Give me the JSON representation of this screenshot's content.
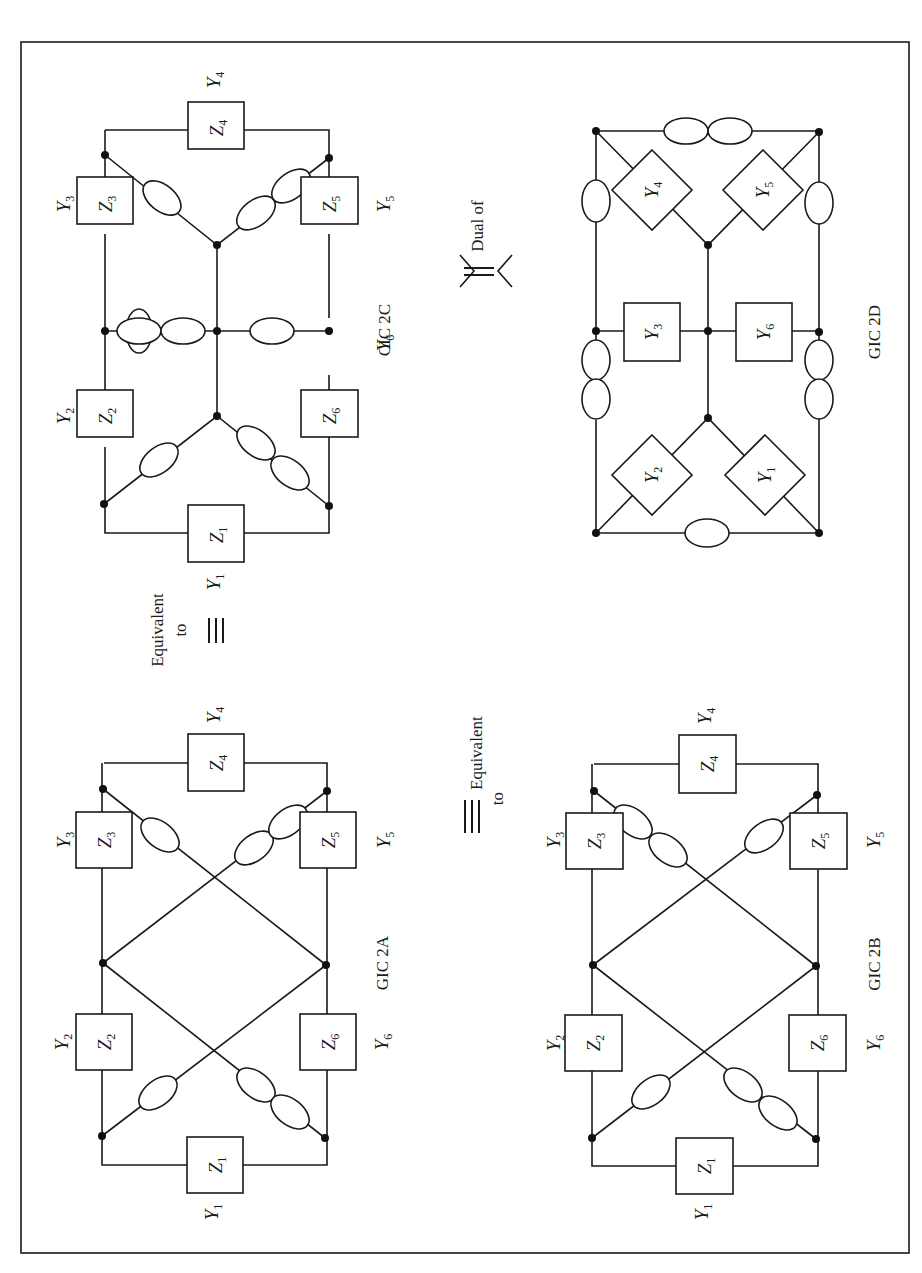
{
  "figure": {
    "orientation": "rotated-90-ccw",
    "frame": {
      "x": 21,
      "y": 42,
      "width": 888,
      "height": 1211
    },
    "colors": {
      "ink": "#1a1a1a",
      "background": "#ffffff"
    }
  },
  "circuits": [
    {
      "id": "cic2c",
      "caption": "CIC 2C",
      "caption_pos": [
        378,
        330
      ],
      "elements_type": "impedance",
      "boxes": [
        {
          "label": "Z",
          "sub": "1",
          "ext_label": "Y",
          "ext_sub": "1",
          "x": 188,
          "y": 505,
          "w": 56,
          "h": 57,
          "ext_pos": [
            207,
            578
          ]
        },
        {
          "label": "Z",
          "sub": "2",
          "ext_label": "Y",
          "ext_sub": "2",
          "x": 77,
          "y": 390,
          "w": 56,
          "h": 57,
          "ext_pos": [
            57,
            415
          ]
        },
        {
          "label": "Z",
          "sub": "3",
          "ext_label": "Y",
          "ext_sub": "3",
          "x": 77,
          "y": 177,
          "w": 56,
          "h": 57,
          "ext_pos": [
            57,
            205
          ]
        },
        {
          "label": "Z",
          "sub": "4",
          "ext_label": "Y",
          "ext_sub": "4",
          "x": 188,
          "y": 83,
          "w": 56,
          "h": 47,
          "ext_pos": [
            207,
            77
          ]
        },
        {
          "label": "Z",
          "sub": "5",
          "ext_label": "Y",
          "ext_sub": "5",
          "x": 301,
          "y": 177,
          "w": 56,
          "h": 57,
          "ext_pos": [
            378,
            205
          ]
        },
        {
          "label": "Z",
          "sub": "6",
          "ext_label": "Y",
          "ext_sub": "6",
          "x": 301,
          "y": 318,
          "w": 56,
          "h": 57,
          "ext_pos": [
            378,
            345
          ]
        }
      ]
    },
    {
      "id": "gic2d",
      "caption": "GIC 2D",
      "caption_pos": [
        873,
        270
      ],
      "elements_type": "admittance",
      "boxes": [
        {
          "label": "Y",
          "sub": "3",
          "x": 624,
          "y": 303,
          "w": 56,
          "h": 58
        },
        {
          "label": "Y",
          "sub": "6",
          "x": 736,
          "y": 303,
          "w": 56,
          "h": 58
        }
      ],
      "diamonds": [
        {
          "label": "Y",
          "sub": "4",
          "cx": 652,
          "cy": 190
        },
        {
          "label": "Y",
          "sub": "5",
          "cx": 763,
          "cy": 190
        },
        {
          "label": "Y",
          "sub": "2",
          "cx": 652,
          "cy": 475
        },
        {
          "label": "Y",
          "sub": "1",
          "cx": 765,
          "cy": 475
        }
      ]
    },
    {
      "id": "gic2a",
      "caption": "GIC 2A",
      "caption_pos": [
        378,
        968
      ],
      "elements_type": "impedance",
      "boxes": [
        {
          "label": "Z",
          "sub": "1",
          "ext_label": "Y",
          "ext_sub": "1",
          "ext_pos": [
            207,
            1210
          ]
        },
        {
          "label": "Z",
          "sub": "2",
          "ext_label": "Y",
          "ext_sub": "2",
          "ext_pos": [
            57,
            1043
          ]
        },
        {
          "label": "Z",
          "sub": "3",
          "ext_label": "Y",
          "ext_sub": "3",
          "ext_pos": [
            57,
            840
          ]
        },
        {
          "label": "Z",
          "sub": "4",
          "ext_label": "Y",
          "ext_sub": "4",
          "ext_pos": [
            207,
            715
          ]
        },
        {
          "label": "Z",
          "sub": "5",
          "ext_label": "Y",
          "ext_sub": "5",
          "ext_pos": [
            378,
            840
          ]
        },
        {
          "label": "Z",
          "sub": "6",
          "ext_label": "Y",
          "ext_sub": "6",
          "ext_pos": [
            378,
            1043
          ]
        }
      ]
    },
    {
      "id": "gic2b",
      "caption": "GIC 2B",
      "caption_pos": [
        873,
        968
      ],
      "elements_type": "impedance",
      "boxes": [
        {
          "label": "Z",
          "sub": "1",
          "ext_label": "Y",
          "ext_sub": "1",
          "ext_pos": [
            697,
            1210
          ]
        },
        {
          "label": "Z",
          "sub": "2",
          "ext_label": "Y",
          "ext_sub": "2",
          "ext_pos": [
            548,
            1043
          ]
        },
        {
          "label": "Z",
          "sub": "3",
          "ext_label": "Y",
          "ext_sub": "3",
          "ext_pos": [
            548,
            840
          ]
        },
        {
          "label": "Z",
          "sub": "4",
          "ext_label": "Y",
          "ext_sub": "4",
          "ext_pos": [
            697,
            715
          ]
        },
        {
          "label": "Z",
          "sub": "5",
          "ext_label": "Y",
          "ext_sub": "5",
          "ext_pos": [
            870,
            840
          ]
        },
        {
          "label": "Z",
          "sub": "6",
          "ext_label": "Y",
          "ext_sub": "6",
          "ext_pos": [
            870,
            1043
          ]
        }
      ]
    }
  ],
  "relations": [
    {
      "text_line1": "Equivalent",
      "text_line2": "to",
      "symbol": "≡",
      "between": [
        "gic2a",
        "cic2c"
      ],
      "pos": [
        170,
        640
      ]
    },
    {
      "text_line1": "Equivalent",
      "text_line2": "to",
      "symbol": "≡",
      "between": [
        "gic2a",
        "gic2b"
      ],
      "pos": [
        475,
        805
      ]
    },
    {
      "text_line1": "Dual of",
      "symbol": "⇕",
      "between": [
        "cic2c",
        "gic2d"
      ],
      "pos": [
        483,
        270
      ]
    }
  ]
}
